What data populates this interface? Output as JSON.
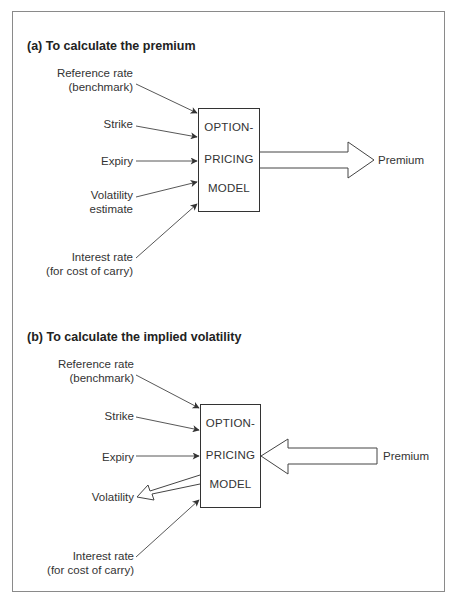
{
  "diagram": {
    "sections": [
      {
        "id": "a",
        "title": "(a) To calculate the premium",
        "inputs": {
          "reference": [
            "Reference rate",
            "(benchmark)"
          ],
          "strike": [
            "Strike"
          ],
          "expiry": [
            "Expiry"
          ],
          "volatility": [
            "Volatility",
            "estimate"
          ],
          "interest": [
            "Interest rate",
            "(for cost of carry)"
          ]
        },
        "model": [
          "OPTION-",
          "PRICING",
          "MODEL"
        ],
        "output": "Premium"
      },
      {
        "id": "b",
        "title": "(b) To calculate the implied volatility",
        "inputs": {
          "reference": [
            "Reference rate",
            "(benchmark)"
          ],
          "strike": [
            "Strike"
          ],
          "expiry": [
            "Expiry"
          ],
          "interest": [
            "Interest rate",
            "(for cost of carry)"
          ],
          "premium": "Premium"
        },
        "model": [
          "OPTION-",
          "PRICING",
          "MODEL"
        ],
        "output": "Volatility"
      }
    ],
    "colors": {
      "line": "#333333",
      "frame": "#8a8a8a",
      "text": "#333333"
    }
  }
}
